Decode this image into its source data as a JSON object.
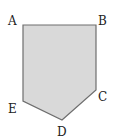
{
  "figure": {
    "shape": "pentagon",
    "fill": "#d9d9d9",
    "stroke": "#6e6e6e",
    "vertices": [
      {
        "label": "A",
        "x": 23,
        "y": 25,
        "lx": 8,
        "ly": 25
      },
      {
        "label": "B",
        "x": 96,
        "y": 25,
        "lx": 98,
        "ly": 25
      },
      {
        "label": "C",
        "x": 96,
        "y": 90,
        "lx": 98,
        "ly": 101
      },
      {
        "label": "D",
        "x": 62,
        "y": 120,
        "lx": 57,
        "ly": 136
      },
      {
        "label": "E",
        "x": 23,
        "y": 101,
        "lx": 8,
        "ly": 113
      }
    ]
  }
}
